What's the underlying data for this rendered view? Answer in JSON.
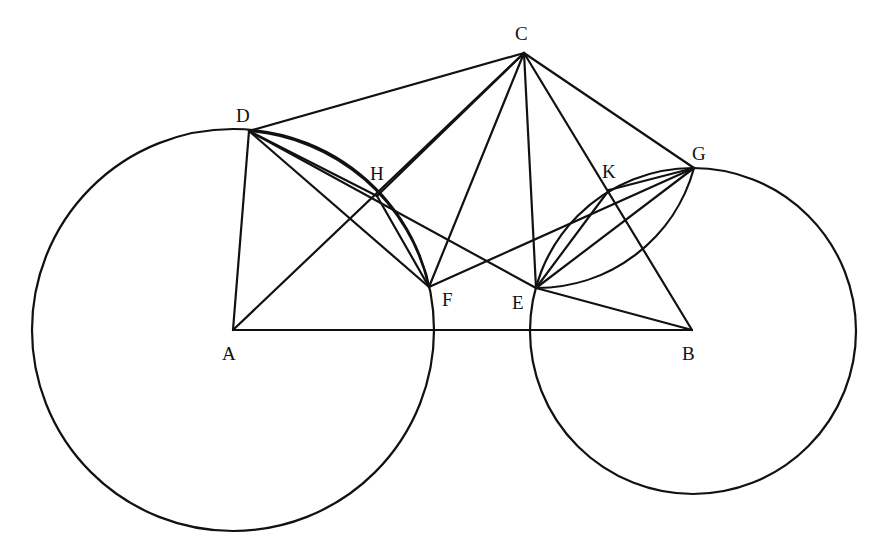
{
  "figure": {
    "title": "",
    "points": {
      "A": {
        "label": "A",
        "x": 233,
        "y": 330,
        "lx": 222,
        "ly": 360
      },
      "B": {
        "label": "B",
        "x": 692,
        "y": 330,
        "lx": 682,
        "ly": 360
      },
      "C": {
        "label": "C",
        "x": 524,
        "y": 53,
        "lx": 515,
        "ly": 40
      },
      "D": {
        "label": "D",
        "x": 249,
        "y": 131,
        "lx": 236,
        "ly": 122
      },
      "E": {
        "label": "E",
        "x": 536,
        "y": 288,
        "lx": 512,
        "ly": 309
      },
      "F": {
        "label": "F",
        "x": 429,
        "y": 287,
        "lx": 442,
        "ly": 306
      },
      "G": {
        "label": "G",
        "x": 694,
        "y": 168,
        "lx": 692,
        "ly": 160
      },
      "H": {
        "label": "H",
        "x": 377,
        "y": 196,
        "lx": 370,
        "ly": 180
      },
      "K": {
        "label": "K",
        "x": 609,
        "y": 190,
        "lx": 602,
        "ly": 178
      }
    },
    "circles": [
      {
        "name": "circle-A",
        "cx": 233,
        "cy": 330,
        "r": 201
      },
      {
        "name": "circle-B",
        "cx": 693,
        "cy": 331,
        "r": 163
      }
    ],
    "segments": [
      [
        "A",
        "B"
      ],
      [
        "A",
        "D"
      ],
      [
        "A",
        "C"
      ],
      [
        "D",
        "C"
      ],
      [
        "C",
        "F"
      ],
      [
        "C",
        "E"
      ],
      [
        "C",
        "B"
      ],
      [
        "C",
        "G"
      ],
      [
        "C",
        "H"
      ],
      [
        "D",
        "H"
      ],
      [
        "H",
        "F"
      ],
      [
        "D",
        "F"
      ],
      [
        "D",
        "E"
      ],
      [
        "E",
        "B"
      ],
      [
        "F",
        "G"
      ],
      [
        "G",
        "K"
      ],
      [
        "K",
        "E"
      ],
      [
        "G",
        "E"
      ]
    ],
    "arcs": [
      {
        "name": "arc-D-H-F",
        "from": "D",
        "to": "F",
        "circle": "circle-A"
      },
      {
        "name": "arc-E-K-G",
        "from": "E",
        "to": "G",
        "circle": "circle-B"
      }
    ]
  }
}
